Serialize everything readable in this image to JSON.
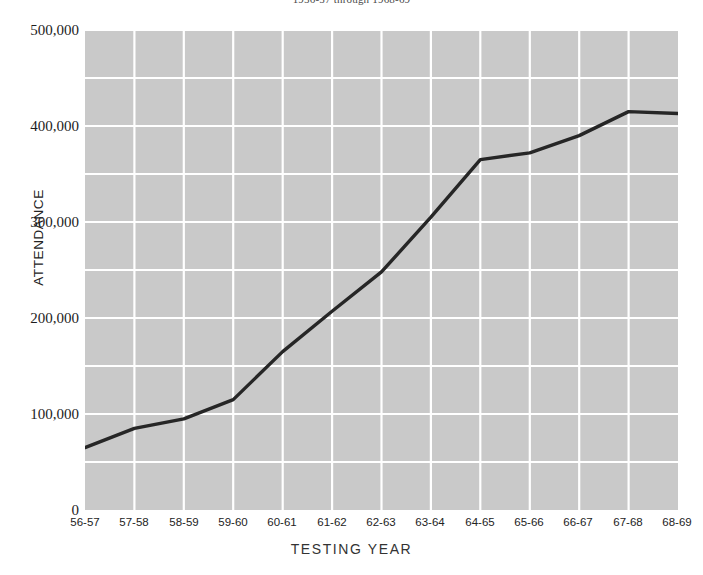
{
  "chart_data": {
    "type": "line",
    "title": "1956-57 through 1968-69",
    "xlabel": "TESTING YEAR",
    "ylabel": "ATTENDANCE",
    "categories": [
      "56-57",
      "57-58",
      "58-59",
      "59-60",
      "60-61",
      "61-62",
      "62-63",
      "63-64",
      "64-65",
      "65-66",
      "66-67",
      "67-68",
      "68-69"
    ],
    "values": [
      65000,
      85000,
      95000,
      115000,
      165000,
      207000,
      248000,
      305000,
      365000,
      372000,
      390000,
      415000,
      413000
    ],
    "series": [
      {
        "name": "Attendance",
        "values": [
          65000,
          85000,
          95000,
          115000,
          165000,
          207000,
          248000,
          305000,
          365000,
          372000,
          390000,
          415000,
          413000
        ]
      }
    ],
    "ylim": [
      0,
      500000
    ],
    "ytick_labels": [
      "500,000",
      "400,000",
      "300,000",
      "200,000",
      "100,000",
      "0"
    ],
    "ytick_values": [
      500000,
      400000,
      300000,
      200000,
      100000,
      0
    ],
    "yminor_values": [
      450000,
      350000,
      250000,
      150000,
      50000
    ],
    "grid": true,
    "grid_color": "#ffffff",
    "plot_background": "#c9c9c9",
    "line_color": "#262626",
    "legend": "none"
  }
}
